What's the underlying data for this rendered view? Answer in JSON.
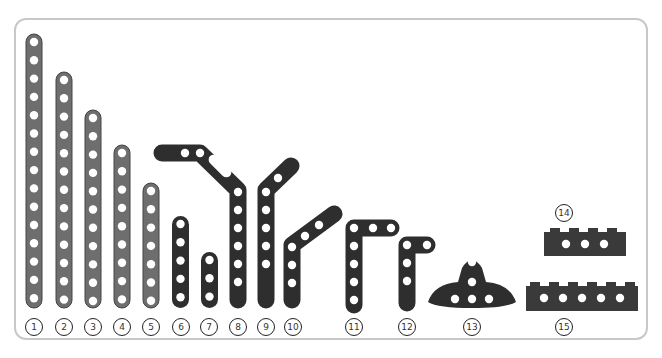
{
  "colors": {
    "frame": "#c8c8c8",
    "light_beam": "#6e6e6e",
    "dark_beam": "#2e2e2e",
    "hole": "#ffffff",
    "label_border": "#222222"
  },
  "parts": [
    {
      "id": 1,
      "label": "1",
      "type": "straight-beam",
      "holes": 15,
      "color": "light-gray"
    },
    {
      "id": 2,
      "label": "2",
      "type": "straight-beam",
      "holes": 13,
      "color": "light-gray"
    },
    {
      "id": 3,
      "label": "3",
      "type": "straight-beam",
      "holes": 11,
      "color": "light-gray"
    },
    {
      "id": 4,
      "label": "4",
      "type": "straight-beam",
      "holes": 9,
      "color": "light-gray"
    },
    {
      "id": 5,
      "label": "5",
      "type": "straight-beam",
      "holes": 7,
      "color": "light-gray"
    },
    {
      "id": 6,
      "label": "6",
      "type": "straight-beam",
      "holes": 5,
      "color": "dark-gray"
    },
    {
      "id": 7,
      "label": "7",
      "type": "straight-beam",
      "holes": 3,
      "color": "dark-gray"
    },
    {
      "id": 8,
      "label": "8",
      "type": "double-angled-beam",
      "color": "dark-gray"
    },
    {
      "id": 9,
      "label": "9",
      "type": "angled-beam",
      "color": "dark-gray"
    },
    {
      "id": 10,
      "label": "10",
      "type": "angled-beam",
      "color": "dark-gray"
    },
    {
      "id": 11,
      "label": "11",
      "type": "L-beam",
      "color": "dark-gray"
    },
    {
      "id": 12,
      "label": "12",
      "type": "L-beam",
      "color": "dark-gray"
    },
    {
      "id": 13,
      "label": "13",
      "type": "T-beam",
      "color": "dark-gray"
    },
    {
      "id": 14,
      "label": "14",
      "type": "technic-brick",
      "holes": 3,
      "color": "dark-gray"
    },
    {
      "id": 15,
      "label": "15",
      "type": "technic-brick",
      "holes": 5,
      "color": "dark-gray"
    }
  ]
}
